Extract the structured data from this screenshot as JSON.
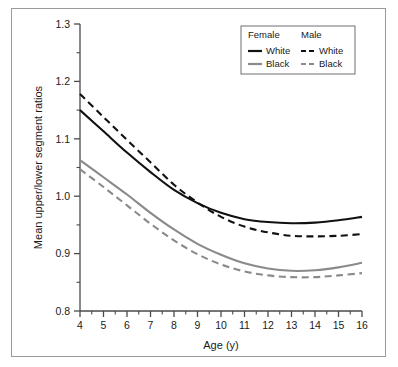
{
  "figure": {
    "name": "mean-upper-lower-segment-ratio-by-age",
    "background_color": "#ffffff",
    "frame_color": "#9a9a9a"
  },
  "legend": {
    "position": "top-right",
    "columns": [
      {
        "header": "Female",
        "entries": [
          {
            "label": "White",
            "color": "#111111",
            "style": "solid"
          },
          {
            "label": "Black",
            "color": "#8a8a8a",
            "style": "solid"
          }
        ]
      },
      {
        "header": "Male",
        "entries": [
          {
            "label": "White",
            "color": "#111111",
            "style": "dashed"
          },
          {
            "label": "Black",
            "color": "#8a8a8a",
            "style": "dashed"
          }
        ]
      }
    ]
  },
  "chart_data": {
    "type": "line",
    "title": "",
    "xlabel": "Age (y)",
    "ylabel": "Mean upper/lower segment ratios",
    "xlim": [
      4,
      16
    ],
    "ylim": [
      0.8,
      1.3
    ],
    "xticks": [
      4,
      5,
      6,
      7,
      8,
      9,
      10,
      11,
      12,
      13,
      14,
      15,
      16
    ],
    "xticklabels": [
      "4",
      "5",
      "6",
      "7",
      "8",
      "9",
      "10",
      "11",
      "12",
      "13",
      "14",
      "15",
      "16"
    ],
    "xminor_step": 0.5,
    "yticks": [
      0.8,
      0.9,
      1.0,
      1.1,
      1.2,
      1.3
    ],
    "yticklabels": [
      "0.8",
      "0.9",
      "1.0",
      "1.1",
      "1.2",
      "1.3"
    ],
    "yminor_step": 0.05,
    "grid": false,
    "legend_position": "upper right",
    "x": [
      4,
      5,
      6,
      7,
      8,
      9,
      10,
      11,
      12,
      13,
      14,
      15,
      16
    ],
    "series": [
      {
        "name": "Female White",
        "sex": "Female",
        "race": "White",
        "color": "#111111",
        "style": "solid",
        "values": [
          1.15,
          1.113,
          1.076,
          1.042,
          1.011,
          0.988,
          0.971,
          0.96,
          0.955,
          0.953,
          0.954,
          0.958,
          0.964
        ]
      },
      {
        "name": "Female Black",
        "sex": "Female",
        "race": "Black",
        "color": "#8a8a8a",
        "style": "solid",
        "values": [
          1.063,
          1.033,
          1.003,
          0.971,
          0.942,
          0.917,
          0.898,
          0.883,
          0.874,
          0.87,
          0.871,
          0.876,
          0.884
        ]
      },
      {
        "name": "Male White",
        "sex": "Male",
        "race": "White",
        "color": "#111111",
        "style": "dashed",
        "values": [
          1.178,
          1.138,
          1.098,
          1.059,
          1.02,
          0.989,
          0.964,
          0.947,
          0.937,
          0.931,
          0.93,
          0.931,
          0.934
        ]
      },
      {
        "name": "Male Black",
        "sex": "Male",
        "race": "Black",
        "color": "#8a8a8a",
        "style": "dashed",
        "values": [
          1.047,
          1.016,
          0.984,
          0.952,
          0.923,
          0.899,
          0.881,
          0.869,
          0.862,
          0.859,
          0.859,
          0.862,
          0.866
        ]
      }
    ]
  }
}
